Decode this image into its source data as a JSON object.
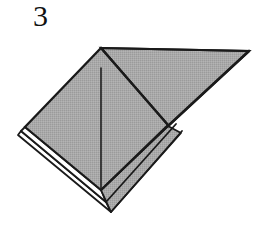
{
  "figure": {
    "kind": "origami-fold-diagram",
    "step_number": "3",
    "caption": "",
    "canvas": {
      "width": 266,
      "height": 225
    },
    "background_color": "#ffffff"
  },
  "colors": {
    "paper_front_fill": "#a9a9a9",
    "paper_back_fill": "#ffffff",
    "outline": "#1a1a1a",
    "fold_line": "#1f1f1f",
    "step_number_color": "#111111"
  },
  "shapes": {
    "main_square": {
      "name": "front-square-panel",
      "fill": "#a9a9a9",
      "points": "101,48 168,125 101,190 25,127"
    },
    "right_triangle": {
      "name": "right-triangle-flap",
      "fill": "#a9a9a9",
      "points": "101,48 249,51 168,126"
    },
    "under_layer_one": {
      "name": "under-layer-one",
      "fill": "#ffffff",
      "points": "25,127 101,190 106,202 21,131"
    },
    "under_layer_two": {
      "name": "under-layer-two",
      "fill": "#ffffff",
      "points": "21,131 106,202 111,212 18,135"
    },
    "lower_right_layer": {
      "name": "lower-right-layer",
      "fill": "#a9a9a9",
      "points": "168,126 101,190 111,212 181,133"
    }
  },
  "lines": {
    "center_fold": {
      "name": "center-vertical-fold-line",
      "x1": 101,
      "y1": 68,
      "x2": 101,
      "y2": 190,
      "width": 1.6
    },
    "flap_diagonal": {
      "name": "flap-diagonal-edge",
      "x1": 101,
      "y1": 48,
      "x2": 168,
      "y2": 125,
      "width": 2.2
    },
    "top_edge": {
      "name": "top-edge",
      "x1": 101,
      "y1": 48,
      "x2": 249,
      "y2": 51,
      "width": 2.2
    },
    "hypotenuse": {
      "name": "triangle-hypotenuse-edge",
      "x1": 249,
      "y1": 51,
      "x2": 168,
      "y2": 126,
      "width": 2.6
    },
    "left_upper_edge": {
      "name": "left-upper-edge",
      "x1": 101,
      "y1": 48,
      "x2": 25,
      "y2": 127,
      "width": 2.4
    },
    "left_lower_edge": {
      "name": "left-lower-edge",
      "x1": 25,
      "y1": 127,
      "x2": 101,
      "y2": 190,
      "width": 2.2
    },
    "layer_edge_a_left": {
      "name": "layer-edge-a-left",
      "x1": 21,
      "y1": 131,
      "x2": 106,
      "y2": 202,
      "width": 2.0
    },
    "layer_edge_b_left": {
      "name": "layer-edge-b-left",
      "x1": 18,
      "y1": 135,
      "x2": 111,
      "y2": 212,
      "width": 2.0
    },
    "layer_edge_a_right": {
      "name": "layer-edge-a-right",
      "x1": 106,
      "y1": 202,
      "x2": 176,
      "y2": 124,
      "width": 2.0
    },
    "layer_edge_b_right": {
      "name": "layer-edge-b-right",
      "x1": 111,
      "y1": 212,
      "x2": 182,
      "y2": 131,
      "width": 2.0
    },
    "inner_right_edge": {
      "name": "inner-right-edge",
      "x1": 168,
      "y1": 126,
      "x2": 101,
      "y2": 190,
      "width": 2.0
    }
  }
}
